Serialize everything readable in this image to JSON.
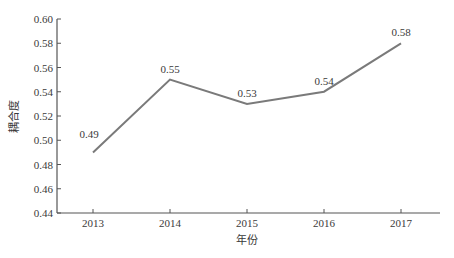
{
  "chart_data": {
    "type": "line",
    "title": "",
    "xlabel": "年份",
    "ylabel": "耦合度",
    "categories": [
      "2013",
      "2014",
      "2015",
      "2016",
      "2017"
    ],
    "series": [
      {
        "name": "耦合度",
        "values": [
          0.49,
          0.55,
          0.53,
          0.54,
          0.58
        ]
      }
    ],
    "data_labels": [
      "0.49",
      "0.55",
      "0.53",
      "0.54",
      "0.58"
    ],
    "ylim": [
      0.44,
      0.6
    ],
    "yticks": [
      "0.44",
      "0.46",
      "0.48",
      "0.50",
      "0.52",
      "0.54",
      "0.56",
      "0.58",
      "0.60"
    ],
    "grid": false,
    "legend": "none",
    "line_color": "#7a7a7a",
    "axis_color": "#555555"
  }
}
